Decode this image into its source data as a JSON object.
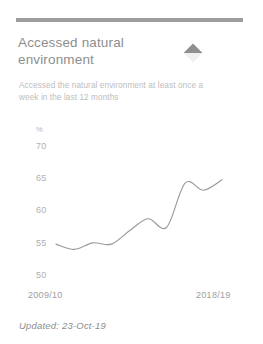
{
  "card": {
    "title": "Accessed natural environment",
    "subtitle": "Accessed the natural environment at least once a week in the last 12 months",
    "trend_icon": "triangle-up-down-icon",
    "trend_direction": "up",
    "updated_label": "Updated: 23-Oct-19",
    "accent_color": "#9d9d9d",
    "line_color": "#9a9a9a",
    "title_color": "#8e8e8e",
    "subtitle_color": "#bdbdbd"
  },
  "chart_data": {
    "type": "line",
    "title": "Accessed natural environment",
    "xlabel": "",
    "ylabel": "%",
    "unit_label": "%",
    "ylim": [
      50,
      70
    ],
    "yticks": [
      50,
      55,
      60,
      65,
      70
    ],
    "ytick_labels": [
      "50",
      "55",
      "60",
      "65",
      "70"
    ],
    "grid": false,
    "legend": "none",
    "x_axis_labels": [
      "2009/10",
      "2018/19"
    ],
    "categories": [
      "2009/10",
      "2010/11",
      "2011/12",
      "2012/13",
      "2013/14",
      "2014/15",
      "2015/16",
      "2016/17",
      "2017/18",
      "2018/19"
    ],
    "values": [
      54.9,
      54.1,
      55.1,
      54.9,
      57.0,
      58.8,
      57.5,
      64.3,
      63.2,
      64.8
    ]
  }
}
